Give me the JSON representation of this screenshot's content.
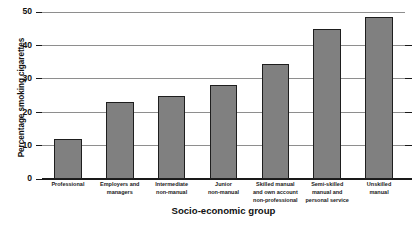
{
  "chart_data": {
    "type": "bar",
    "title": "",
    "xlabel": "Socio-economic group",
    "ylabel": "Percentage smoking cigarettes",
    "categories": [
      "Professional",
      "Employers and managers",
      "Intermediate non-manual",
      "Junior non-manual",
      "Skilled manual and own account non-professional",
      "Semi-skilled manual and personal service",
      "Unskilled manual"
    ],
    "category_lines": [
      [
        "Professional"
      ],
      [
        "Employers and",
        "managers"
      ],
      [
        "Intermediate",
        "non-manual"
      ],
      [
        "Junior",
        "non-manual"
      ],
      [
        "Skilled manual",
        "and own account",
        "non-professional"
      ],
      [
        "Semi-skilled",
        "manual and",
        "personal service"
      ],
      [
        "Unskilled",
        "manual"
      ]
    ],
    "values": [
      12,
      23,
      25,
      28,
      34.5,
      45,
      48.5
    ],
    "ylim": [
      0,
      50
    ],
    "yticks": [
      0,
      10,
      20,
      30,
      40,
      50
    ],
    "ytick_labels": [
      "0",
      "10",
      "20",
      "30",
      "40",
      "50"
    ],
    "grid": true,
    "legend": "none",
    "bar_color": "#808080",
    "bar_edge_color": "#1e1e1e",
    "gridline_color": "#8e8e8e",
    "axis_color": "#1a1a1a"
  }
}
